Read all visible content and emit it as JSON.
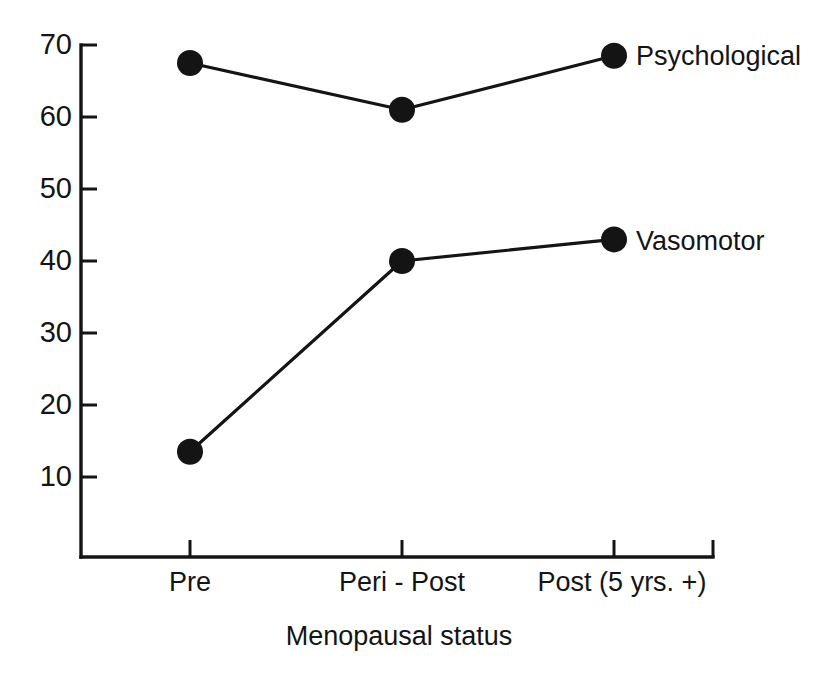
{
  "chart_data": {
    "type": "line",
    "title": "",
    "subtitle": "",
    "xlabel": "Menopausal status",
    "ylabel": "",
    "categories": [
      "Pre",
      "Peri - Post",
      "Post (5 yrs. +)"
    ],
    "series": [
      {
        "name": "Psychological",
        "values": [
          67.5,
          61,
          68.5
        ]
      },
      {
        "name": "Vasomotor",
        "values": [
          13.5,
          40,
          43
        ]
      }
    ],
    "ylim": [
      0,
      70
    ],
    "yticks": [
      10,
      20,
      30,
      40,
      50,
      60,
      70
    ],
    "ytick_labels": [
      "10",
      "20",
      "30",
      "40",
      "50",
      "60",
      "70"
    ],
    "grid": false,
    "legend_position": "right-inline-labels",
    "marker": "filled-circle",
    "marker_color": "#141414",
    "line_color": "#141414",
    "background_color": "#ffffff"
  },
  "labels": {
    "x_axis_title": "Menopausal status",
    "series_psychological": "Psychological",
    "series_vasomotor": "Vasomotor",
    "xtick_0": "Pre",
    "xtick_1": "Peri - Post",
    "xtick_2": "Post (5 yrs. +)",
    "ytick_70": "70",
    "ytick_60": "60",
    "ytick_50": "50",
    "ytick_40": "40",
    "ytick_30": "30",
    "ytick_20": "20",
    "ytick_10": "10"
  }
}
